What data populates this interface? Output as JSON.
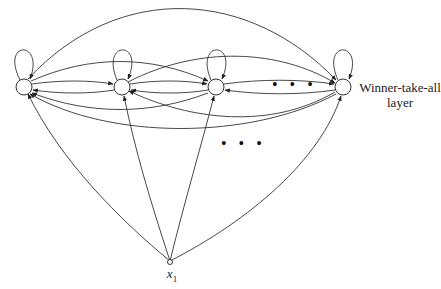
{
  "diagram": {
    "layer_label_line1": "Winner-take-all",
    "layer_label_line2": "layer",
    "input_label": "x",
    "input_subscript": "1",
    "ellipsis_top": "• • •",
    "ellipsis_bottom": "• • •",
    "nodes": [
      {
        "id": "n1",
        "x": 24,
        "y": 87
      },
      {
        "id": "n2",
        "x": 122,
        "y": 87
      },
      {
        "id": "n3",
        "x": 216,
        "y": 87
      },
      {
        "id": "n4",
        "x": 343,
        "y": 87
      }
    ],
    "input_node": {
      "id": "x1",
      "x": 170,
      "y": 262
    },
    "stroke_color": "#333333"
  }
}
